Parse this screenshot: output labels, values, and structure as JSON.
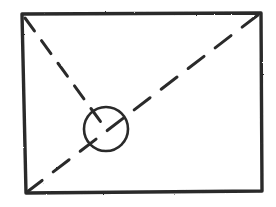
{
  "diagram": {
    "title": "Image placeholder wireframe sketch",
    "stroke_color": "#2a2a2a",
    "background": "#ffffff",
    "frame": {
      "points": [
        [
          24,
          14
        ],
        [
          260,
          13
        ],
        [
          262,
          191
        ],
        [
          26,
          193
        ]
      ]
    },
    "diagonal_a": {
      "from": [
        24,
        17
      ],
      "to": [
        102,
        124
      ],
      "style": "dashed"
    },
    "diagonal_b": {
      "from": [
        259,
        14
      ],
      "to": [
        27,
        192
      ],
      "style": "dashed"
    },
    "circle": {
      "cx": 106,
      "cy": 129,
      "r": 22
    }
  }
}
